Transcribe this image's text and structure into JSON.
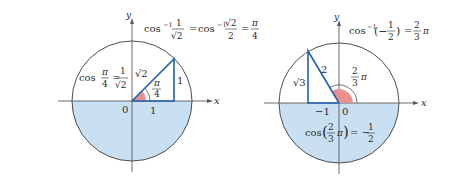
{
  "colors": {
    "shade": "#c9e0f2",
    "axis": "#5a5a5a",
    "circle": "#3a3a3a",
    "triangle": "#1f5fb0",
    "angle_fill": "#eb8f8f",
    "text": "#2b2b2b"
  },
  "left": {
    "axis_x": "x",
    "axis_y": "y",
    "origin": "0",
    "base_label": "1",
    "height_label": "1",
    "hyp_label": "√2",
    "angle_num": "π",
    "angle_den": "4",
    "cos_text": "cos",
    "cos_arg_num": "π",
    "cos_arg_den": "4",
    "cos_eq": "=",
    "cos_val_num": "1",
    "cos_val_den": "√2",
    "header": {
      "arccos": "cos",
      "sup": "−1",
      "f1_num": "1",
      "f1_den": "√2",
      "eq1": "=",
      "arccos2": "cos",
      "sup2": "−1",
      "f2_num": "√2",
      "f2_den": "2",
      "eq2": "=",
      "f3_num": "π",
      "f3_den": "4"
    }
  },
  "right": {
    "axis_x": "x",
    "axis_y": "y",
    "origin": "0",
    "base_label": "−1",
    "height_label": "√3",
    "hyp_label": "2",
    "angle_num": "2",
    "angle_den": "3",
    "angle_pi": "π",
    "cos_text": "cos",
    "cos_lp": "(",
    "cos_arg_num": "2",
    "cos_arg_den": "3",
    "cos_arg_pi": "π",
    "cos_rp": ")",
    "cos_eq": "= −",
    "cos_val_num": "1",
    "cos_val_den": "2",
    "header": {
      "arccos": "cos",
      "sup": "−1",
      "lp": "(−",
      "f_num": "1",
      "f_den": "2",
      "rp": ")",
      "eq": "=",
      "r_num": "2",
      "r_den": "3",
      "r_pi": "π"
    }
  }
}
